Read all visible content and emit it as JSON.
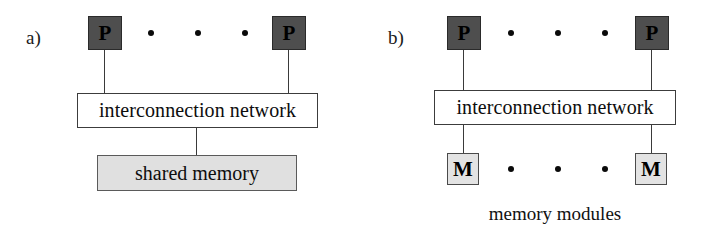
{
  "figure": {
    "background_color": "#ffffff",
    "node_fill_processor": "#4e4e4e",
    "node_fill_memory": "#e3e3e3",
    "shared_memory_fill": "#e0e0e0",
    "line_color": "#3a3a3a"
  },
  "panels": [
    {
      "id": "a",
      "label": "a)",
      "processors": [
        {
          "label": "P"
        },
        {
          "label": "P"
        }
      ],
      "processor_ellipsis_dots": 3,
      "network": {
        "label": "interconnection network"
      },
      "memory": {
        "label": "shared memory"
      }
    },
    {
      "id": "b",
      "label": "b)",
      "processors": [
        {
          "label": "P"
        },
        {
          "label": "P"
        }
      ],
      "processor_ellipsis_dots": 3,
      "network": {
        "label": "interconnection network"
      },
      "memories": [
        {
          "label": "M"
        },
        {
          "label": "M"
        }
      ],
      "memory_ellipsis_dots": 3,
      "caption": "memory modules"
    }
  ]
}
